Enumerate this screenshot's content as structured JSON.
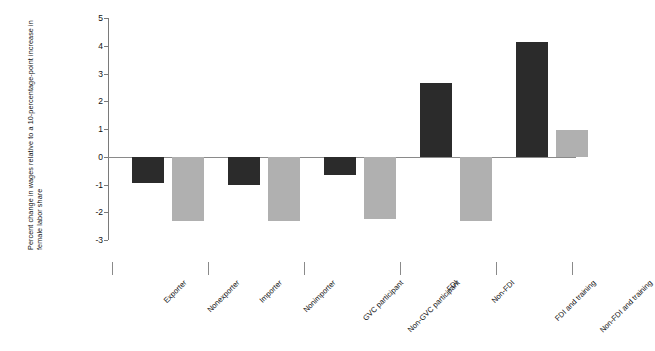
{
  "chart_data": {
    "type": "bar",
    "title": "",
    "subtitle": "",
    "xlabel": "",
    "ylabel": "Percent change in wages relative to a 10-percentage-point increase in female labor share",
    "ylim": [
      -3,
      5
    ],
    "yticks": [
      "5",
      "4",
      "3",
      "2",
      "1",
      "0",
      "-1",
      "-2",
      "-3"
    ],
    "grid": false,
    "legend": "none",
    "categories": [
      "Exporter",
      "Nonexporter",
      "Importer",
      "Nonimporter",
      "GVC participant",
      "Non-GVC participant",
      "FDI",
      "Non-FDI",
      "FDI and training",
      "Non-FDI and training"
    ],
    "values": [
      -0.95,
      -2.3,
      -1.0,
      -2.3,
      -0.65,
      -2.25,
      2.65,
      -2.3,
      4.15,
      0.95
    ],
    "bar_colors": [
      "#2b2b2b",
      "#b0b0b0",
      "#2b2b2b",
      "#b0b0b0",
      "#2b2b2b",
      "#b0b0b0",
      "#2b2b2b",
      "#b0b0b0",
      "#2b2b2b",
      "#b0b0b0"
    ],
    "groups": [
      {
        "name": "Trade - exporter status",
        "categories": [
          "Exporter",
          "Nonexporter"
        ]
      },
      {
        "name": "Trade - importer status",
        "categories": [
          "Importer",
          "Nonimporter"
        ]
      },
      {
        "name": "GVC participation",
        "categories": [
          "GVC participant",
          "Non-GVC participant"
        ]
      },
      {
        "name": "FDI status",
        "categories": [
          "FDI",
          "Non-FDI"
        ]
      },
      {
        "name": "FDI and training",
        "categories": [
          "FDI and training",
          "Non-FDI and training"
        ]
      }
    ]
  },
  "colors": {
    "dark_series": "#2b2b2b",
    "light_series": "#b0b0b0",
    "axis": "#7a7a7a",
    "background": "#ffffff"
  }
}
